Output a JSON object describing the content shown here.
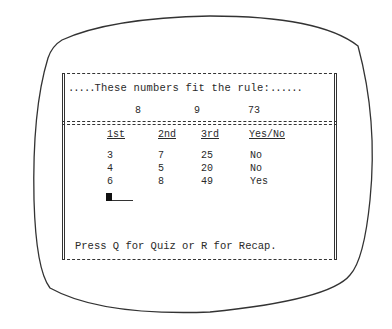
{
  "screen": {
    "header": {
      "leading_dots": ".....",
      "title": "These numbers fit the rule:",
      "trailing_dots": "......"
    },
    "example": {
      "values": [
        "8",
        "9",
        "73"
      ]
    },
    "table": {
      "headers": [
        "1st",
        "2nd",
        "3rd",
        "Yes/No"
      ],
      "rows": [
        [
          "3",
          "7",
          "25",
          "No"
        ],
        [
          "4",
          "5",
          "20",
          "No"
        ],
        [
          "6",
          "8",
          "49",
          "Yes"
        ]
      ]
    },
    "prompt": "Press Q for Quiz or R for Recap."
  }
}
